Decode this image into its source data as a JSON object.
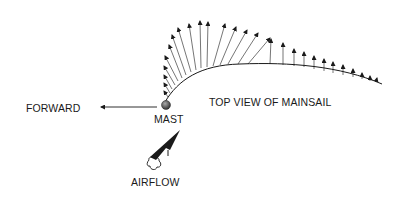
{
  "labels": {
    "forward": "FORWARD",
    "mast": "MAST",
    "title": "TOP VIEW OF MAINSAIL",
    "airflow": "AIRFLOW"
  },
  "colors": {
    "ink": "#1a1a1a",
    "mast": "#555555",
    "background": "#ffffff"
  },
  "sail_curve": "M 165 102 C 178 80, 200 65, 240 64 C 290 62, 340 66, 382 84",
  "pressure_arrows": [
    {
      "x1": 168,
      "y1": 97,
      "x2": 164,
      "y2": 91
    },
    {
      "x1": 170,
      "y1": 93,
      "x2": 164,
      "y2": 83
    },
    {
      "x1": 172,
      "y1": 89,
      "x2": 164,
      "y2": 75
    },
    {
      "x1": 175,
      "y1": 85,
      "x2": 164,
      "y2": 66
    },
    {
      "x1": 178,
      "y1": 81,
      "x2": 165,
      "y2": 56
    },
    {
      "x1": 182,
      "y1": 78,
      "x2": 169,
      "y2": 45
    },
    {
      "x1": 186,
      "y1": 75,
      "x2": 172,
      "y2": 35
    },
    {
      "x1": 191,
      "y1": 72,
      "x2": 178,
      "y2": 28
    },
    {
      "x1": 196,
      "y1": 70,
      "x2": 189,
      "y2": 24
    },
    {
      "x1": 201,
      "y1": 68,
      "x2": 200,
      "y2": 21
    },
    {
      "x1": 207,
      "y1": 67,
      "x2": 208,
      "y2": 22
    },
    {
      "x1": 213,
      "y1": 66,
      "x2": 225,
      "y2": 24
    },
    {
      "x1": 220,
      "y1": 65,
      "x2": 236,
      "y2": 27
    },
    {
      "x1": 228,
      "y1": 64,
      "x2": 247,
      "y2": 30
    },
    {
      "x1": 238,
      "y1": 64,
      "x2": 258,
      "y2": 33
    },
    {
      "x1": 248,
      "y1": 64,
      "x2": 270,
      "y2": 38
    },
    {
      "x1": 270,
      "y1": 64,
      "x2": 271,
      "y2": 39
    },
    {
      "x1": 283,
      "y1": 65,
      "x2": 283,
      "y2": 43
    },
    {
      "x1": 294,
      "y1": 66,
      "x2": 294,
      "y2": 49
    },
    {
      "x1": 304,
      "y1": 67,
      "x2": 304,
      "y2": 52
    },
    {
      "x1": 314,
      "y1": 69,
      "x2": 314,
      "y2": 56
    },
    {
      "x1": 324,
      "y1": 71,
      "x2": 324,
      "y2": 59
    },
    {
      "x1": 333,
      "y1": 73,
      "x2": 333,
      "y2": 62
    },
    {
      "x1": 343,
      "y1": 75,
      "x2": 343,
      "y2": 65
    },
    {
      "x1": 353,
      "y1": 77,
      "x2": 353,
      "y2": 69
    },
    {
      "x1": 362,
      "y1": 79,
      "x2": 362,
      "y2": 73
    },
    {
      "x1": 370,
      "y1": 81,
      "x2": 370,
      "y2": 76
    },
    {
      "x1": 376,
      "y1": 82,
      "x2": 377,
      "y2": 78
    }
  ],
  "forward_arrow": {
    "x1": 157,
    "y1": 107,
    "x2": 101,
    "y2": 107
  },
  "mast": {
    "cx": 166,
    "cy": 105,
    "r": 4.5
  }
}
